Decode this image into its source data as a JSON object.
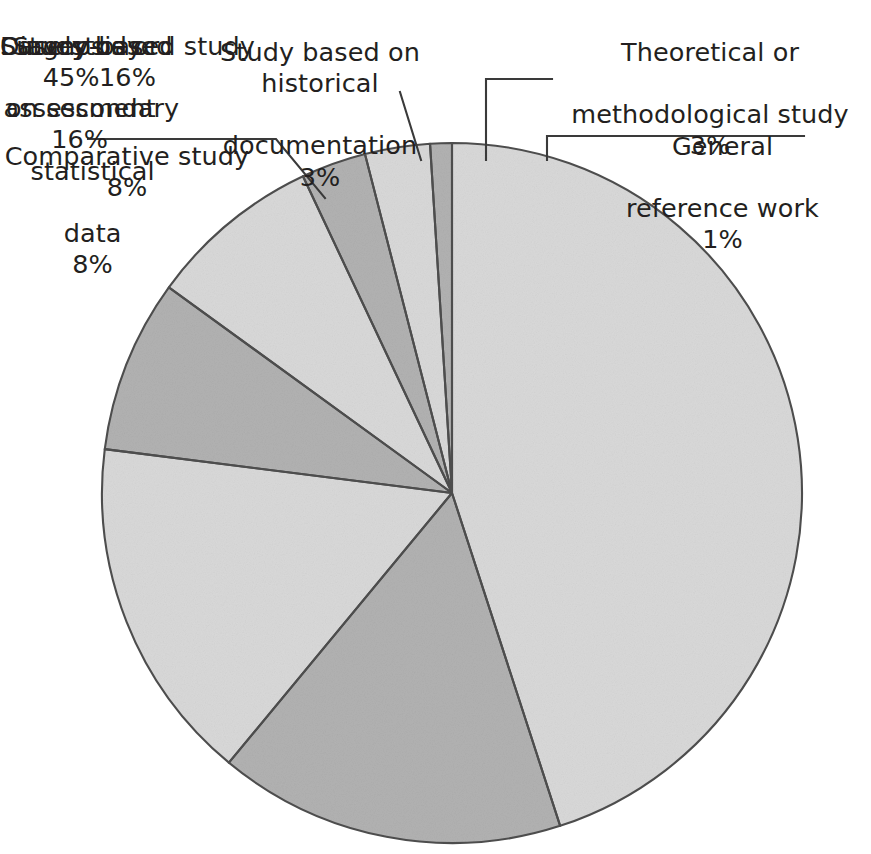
{
  "chart_data": {
    "type": "pie",
    "title": "",
    "subtitle": "",
    "xlabel": "",
    "ylabel": "",
    "legend_position": "none",
    "grid": false,
    "value_unit": "%",
    "total": 100,
    "categories": [
      "Case study",
      "Diagnosis or assessment",
      "Survey-based study",
      "Study based on secondary statistical data",
      "Comparative study",
      "Study based on historical documentation",
      "Theoretical or methodological study",
      "General reference work"
    ],
    "values": [
      45,
      16,
      16,
      8,
      8,
      3,
      3,
      1
    ],
    "slices": [
      {
        "name": "Case study",
        "label": "Case study",
        "value": 45,
        "value_text": "45%",
        "fill": "#d9d9d9",
        "label_placement": "inside"
      },
      {
        "name": "Diagnosis or assessment",
        "label": "Diagnosis or\nassessment",
        "value": 16,
        "value_text": "16%",
        "fill": "#b2b2b2",
        "label_placement": "inside"
      },
      {
        "name": "Survey-based study",
        "label": "Survey-based study",
        "value": 16,
        "value_text": "16%",
        "fill": "#d9d9d9",
        "label_placement": "inside"
      },
      {
        "name": "Study based on secondary statistical data",
        "label": "Study based\non secondary\nstatistical\ndata",
        "value": 8,
        "value_text": "8%",
        "fill": "#b2b2b2",
        "label_placement": "outside"
      },
      {
        "name": "Comparative study",
        "label": "Comparative study",
        "value": 8,
        "value_text": "8%",
        "fill": "#d9d9d9",
        "label_placement": "outside-leader"
      },
      {
        "name": "Study based on historical documentation",
        "label": "Study based on historical\ndocumentation",
        "value": 3,
        "value_text": "3%",
        "fill": "#b2b2b2",
        "label_placement": "outside-leader"
      },
      {
        "name": "Theoretical or methodological study",
        "label": "Theoretical or\nmethodological study",
        "value": 3,
        "value_text": "3%",
        "fill": "#d9d9d9",
        "label_placement": "outside-leader"
      },
      {
        "name": "General reference work",
        "label": "General\nreference work",
        "value": 1,
        "value_text": "1%",
        "fill": "#b2b2b2",
        "label_placement": "outside-leader"
      }
    ],
    "colors": {
      "light_gray": "#d9d9d9",
      "medium_gray": "#b2b2b2",
      "outline": "#4d4d4d",
      "text": "#231f20",
      "background": "#ffffff"
    },
    "geometry": {
      "center_x": 452,
      "center_y": 493,
      "radius": 350,
      "start_angle_deg": 0,
      "direction": "clockwise"
    }
  },
  "labels": {
    "case_study": {
      "text": "Case study",
      "pct": "45%"
    },
    "diagnosis": {
      "line1": "Diagnosis or",
      "line2": "assessment",
      "pct": "16%"
    },
    "survey": {
      "text": "Survey-based study",
      "pct": "16%"
    },
    "secondary": {
      "line1": "Study based",
      "line2": "on secondary",
      "line3": "statistical",
      "line4": "data",
      "pct": "8%"
    },
    "comparative": {
      "text": "Comparative study",
      "pct": "8%"
    },
    "historical": {
      "line1": "Study based on historical",
      "line2": "documentation",
      "pct": "3%"
    },
    "theoretical": {
      "line1": "Theoretical or",
      "line2": "methodological study",
      "pct": "3%"
    },
    "general": {
      "line1": "General",
      "line2": "reference work",
      "pct": "1%"
    }
  }
}
